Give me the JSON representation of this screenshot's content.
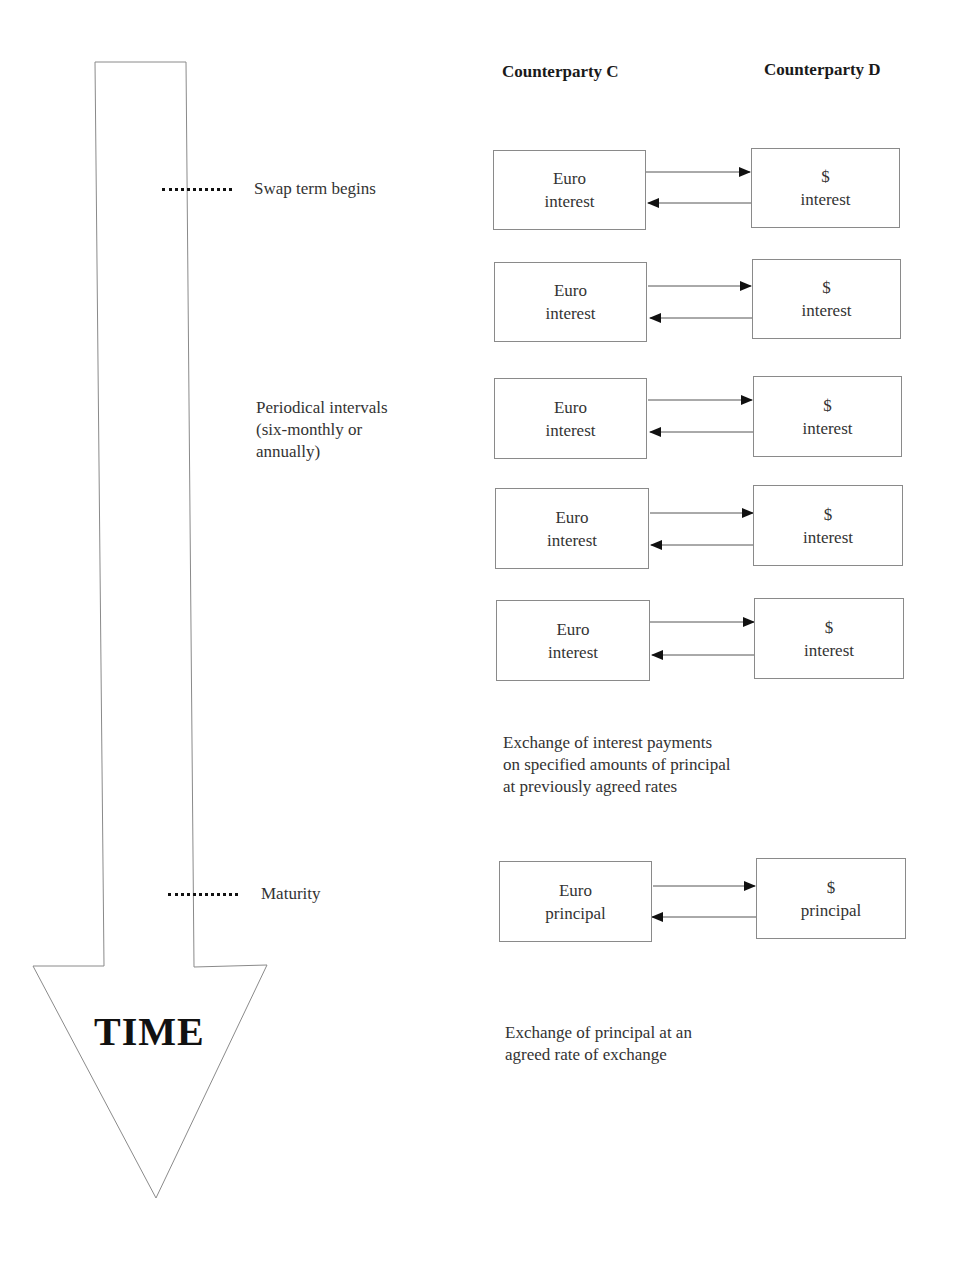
{
  "headers": {
    "left": "Counterparty C",
    "right": "Counterparty D"
  },
  "timeline": {
    "arrow_label": "TIME",
    "markers": [
      {
        "label": "Swap term begins"
      },
      {
        "label": "Periodical intervals",
        "line2": "(six-monthly or",
        "line3": "annually)"
      },
      {
        "label": "Maturity"
      }
    ]
  },
  "exchanges": [
    {
      "left_line1": "Euro",
      "left_line2": "interest",
      "right_line1": "$",
      "right_line2": "interest"
    },
    {
      "left_line1": "Euro",
      "left_line2": "interest",
      "right_line1": "$",
      "right_line2": "interest"
    },
    {
      "left_line1": "Euro",
      "left_line2": "interest",
      "right_line1": "$",
      "right_line2": "interest"
    },
    {
      "left_line1": "Euro",
      "left_line2": "interest",
      "right_line1": "$",
      "right_line2": "interest"
    },
    {
      "left_line1": "Euro",
      "left_line2": "interest",
      "right_line1": "$",
      "right_line2": "interest"
    },
    {
      "left_line1": "Euro",
      "left_line2": "principal",
      "right_line1": "$",
      "right_line2": "principal"
    }
  ],
  "notes": {
    "interest": {
      "line1": "Exchange of interest payments",
      "line2": "on specified amounts of principal",
      "line3": "at previously agreed rates"
    },
    "principal": {
      "line1": "Exchange of principal at an",
      "line2": "agreed rate of exchange"
    }
  }
}
